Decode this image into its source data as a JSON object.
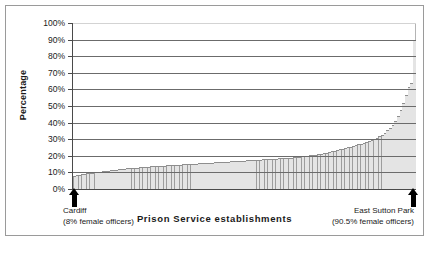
{
  "chart_data": {
    "type": "bar",
    "title": "",
    "xlabel": "Prison Service establishments",
    "ylabel": "Percentage",
    "ylim": [
      0,
      100
    ],
    "ytick_labels": [
      "100%",
      "90%",
      "80%",
      "70%",
      "60%",
      "50%",
      "40%",
      "30%",
      "20%",
      "10%",
      "0%"
    ],
    "ytick_values": [
      100,
      90,
      80,
      70,
      60,
      50,
      40,
      30,
      20,
      10,
      0
    ],
    "yunit": "%",
    "grid": true,
    "legend": false,
    "xtick_labels": [],
    "categories_note": "Individual Prison Service establishments, sorted ascending by percentage of female officers",
    "values": [
      8.0,
      8.3,
      8.6,
      8.9,
      9.2,
      9.5,
      9.8,
      10.0,
      10.2,
      10.4,
      10.6,
      10.8,
      11.0,
      11.2,
      11.4,
      11.6,
      11.8,
      12.0,
      12.1,
      12.3,
      12.5,
      12.6,
      12.8,
      12.9,
      13.0,
      13.2,
      13.3,
      13.4,
      13.6,
      13.7,
      13.8,
      13.9,
      14.0,
      14.1,
      14.2,
      14.3,
      14.4,
      14.5,
      14.6,
      14.7,
      14.8,
      14.9,
      15.0,
      15.1,
      15.2,
      15.3,
      15.4,
      15.5,
      15.6,
      15.7,
      15.8,
      15.9,
      16.0,
      16.1,
      16.2,
      16.3,
      16.4,
      16.5,
      16.6,
      16.7,
      16.8,
      16.9,
      17.0,
      17.1,
      17.2,
      17.3,
      17.4,
      17.5,
      17.6,
      17.7,
      17.8,
      17.9,
      18.0,
      18.1,
      18.2,
      18.3,
      18.4,
      18.5,
      18.6,
      18.7,
      18.8,
      18.9,
      19.0,
      19.2,
      19.4,
      19.6,
      19.8,
      20.0,
      20.2,
      20.4,
      20.6,
      20.9,
      21.2,
      21.5,
      21.8,
      22.1,
      22.4,
      22.8,
      23.2,
      23.6,
      24.0,
      24.4,
      24.8,
      25.2,
      25.6,
      26.0,
      26.5,
      27.0,
      27.5,
      28.0,
      28.6,
      29.2,
      29.8,
      30.5,
      31.2,
      32.0,
      33.0,
      34.2,
      35.5,
      37.0,
      39.0,
      41.5,
      44.5,
      48.0,
      52.0,
      57.0,
      62.0,
      64.0,
      90.5
    ],
    "annotations": [
      {
        "name": "lowest-value-marker",
        "position": "left",
        "label": "Cardiff",
        "detail": "(8% female officers)",
        "value": 8.0
      },
      {
        "name": "highest-value-marker",
        "position": "right",
        "label": "East Sutton Park",
        "detail": "(90.5% female officers)",
        "value": 90.5
      }
    ],
    "colors": {
      "bar_fill": "#d3d3d3",
      "bar_hatch": "#9d9d9d",
      "bar_edge": "#8e8e8e",
      "gridline": "#6b6b6b",
      "axis": "#4a4a4a",
      "text": "#1a1a1a",
      "frame": "#9a9a9a",
      "background": "#ffffff"
    }
  }
}
